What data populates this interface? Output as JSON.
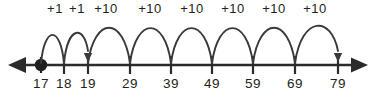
{
  "figure": {
    "type": "number-line-jumps-diagram",
    "axis": {
      "line_color": "#2c2b2b",
      "y": 65,
      "x_start": 10,
      "x_end": 366,
      "left_arrow": "left-arrowhead",
      "right_arrow": "right-arrowhead"
    },
    "start_point": {
      "label": "17",
      "x": 41,
      "marker": "filled-dot"
    },
    "ticks": [
      {
        "label": "17",
        "x": 41
      },
      {
        "label": "18",
        "x": 64
      },
      {
        "label": "19",
        "x": 88
      },
      {
        "label": "29",
        "x": 130
      },
      {
        "label": "39",
        "x": 171
      },
      {
        "label": "49",
        "x": 212
      },
      {
        "label": "59",
        "x": 253
      },
      {
        "label": "69",
        "x": 295
      },
      {
        "label": "79",
        "x": 338
      }
    ],
    "jumps": [
      {
        "label": "+1",
        "from_x": 41,
        "to_x": 64,
        "from_value": "17",
        "to_value": "18",
        "arrowhead": false,
        "label_x": 55
      },
      {
        "label": "+1",
        "from_x": 64,
        "to_x": 88,
        "from_value": "18",
        "to_value": "19",
        "arrowhead": true,
        "label_x": 77
      },
      {
        "label": "+10",
        "from_x": 88,
        "to_x": 130,
        "from_value": "19",
        "to_value": "29",
        "arrowhead": false,
        "label_x": 106
      },
      {
        "label": "+10",
        "from_x": 130,
        "to_x": 171,
        "from_value": "29",
        "to_value": "39",
        "arrowhead": false,
        "label_x": 150
      },
      {
        "label": "+10",
        "from_x": 171,
        "to_x": 212,
        "from_value": "39",
        "to_value": "49",
        "arrowhead": false,
        "label_x": 192
      },
      {
        "label": "+10",
        "from_x": 212,
        "to_x": 253,
        "from_value": "49",
        "to_value": "59",
        "arrowhead": false,
        "label_x": 233
      },
      {
        "label": "+10",
        "from_x": 253,
        "to_x": 295,
        "from_value": "59",
        "to_value": "69",
        "arrowhead": false,
        "label_x": 274
      },
      {
        "label": "+10",
        "from_x": 295,
        "to_x": 338,
        "from_value": "69",
        "to_value": "79",
        "arrowhead": true,
        "label_x": 315
      }
    ],
    "colors": {
      "ink": "#231f20",
      "axis": "#2c2b2b",
      "arc": "#3a3a3a",
      "background": "#ffffff"
    }
  }
}
